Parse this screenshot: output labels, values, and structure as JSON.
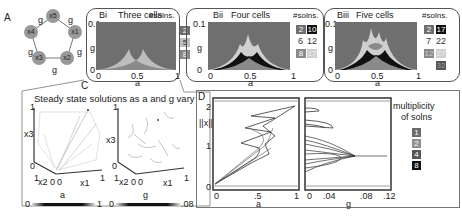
{
  "panel_a": {
    "letter": "A",
    "nodes": [
      "x5",
      "x1",
      "x2",
      "x3",
      "x4"
    ],
    "edge_label": "g"
  },
  "panel_b": [
    {
      "letter": "Bi",
      "title": "Three cells",
      "legend_title": "#solns.",
      "legend": [
        {
          "value": "2",
          "color": "#6f6f6f"
        },
        {
          "value": "5",
          "color": "#bdbdbd"
        },
        {
          "value": "8",
          "color": "#8a8a8a"
        }
      ]
    },
    {
      "letter": "Bii",
      "title": "Four cells",
      "legend_title": "#solns.",
      "legend": [
        {
          "value": "2",
          "color": "#6f6f6f"
        },
        {
          "value": "10",
          "color": "#111"
        },
        {
          "value": "6",
          "color": "#fff"
        },
        {
          "value": "12",
          "color": "#fff"
        },
        {
          "value": "8",
          "color": "#8a8a8a"
        },
        {
          "value": "17",
          "color": "#cfcfcf"
        }
      ]
    },
    {
      "letter": "Biii",
      "title": "Five cells",
      "legend_title": "#solns.",
      "legend": [
        {
          "value": "2",
          "color": "#6f6f6f"
        },
        {
          "value": "17",
          "color": "#111"
        },
        {
          "value": "7",
          "color": "#fff"
        },
        {
          "value": "22",
          "color": "#fff"
        },
        {
          "value": "12",
          "color": "#8a8a8a"
        },
        {
          "value": "27",
          "color": "#cfcfcf"
        },
        {
          "value": "32",
          "color": "#555"
        }
      ]
    }
  ],
  "b_axes": {
    "ylabel": "g",
    "xlabel": "a",
    "y_top": "0.1",
    "y_bottom": "0",
    "x_ticks": [
      "0",
      "0.5",
      "1"
    ]
  },
  "panel_c": {
    "letter": "C",
    "title": "Steady state solutions as a and g vary",
    "axes": {
      "x1": "x1",
      "x2": "x2",
      "x3": "x3",
      "one": "1",
      "zero": "0"
    },
    "colorbar_a": {
      "label": "a",
      "min": "0",
      "max": "1"
    },
    "colorbar_g": {
      "label": "g",
      "min": "0",
      "max": ".08"
    }
  },
  "panel_d": {
    "letter": "D",
    "ylabel": "||x||",
    "y_ticks": [
      "2",
      "1",
      "0"
    ],
    "left_xlabel": "a",
    "left_xticks": [
      "0",
      ".5",
      "1"
    ],
    "right_xlabel": "g",
    "right_xticks": [
      "0",
      ".04",
      ".08",
      ".12"
    ],
    "legend_title_1": "multiplicity",
    "legend_title_2": "of solns",
    "legend": [
      {
        "value": "1",
        "color": "#6b6b6b"
      },
      {
        "value": "2",
        "color": "#8f8f8f"
      },
      {
        "value": "4",
        "color": "#555"
      },
      {
        "value": "8",
        "color": "#111"
      }
    ]
  }
}
